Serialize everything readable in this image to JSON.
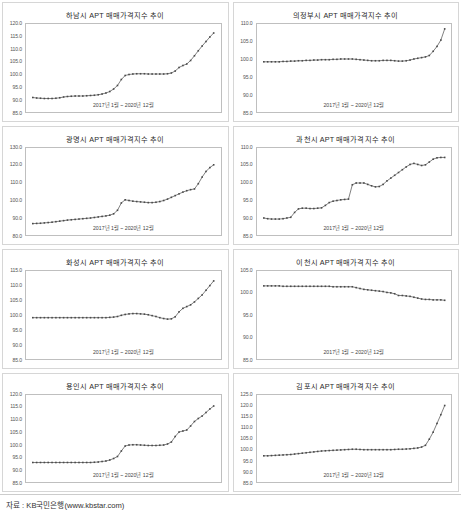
{
  "footer": {
    "source_label": "자료 : KB국민은행(www.kbstar.com)"
  },
  "common": {
    "x_caption": "2017년 1월 ~ 2020년 12월",
    "marker_color": "#4a4a4a",
    "line_color": "#4a4a4a",
    "border_color": "#bfbfbf",
    "title_color": "#2a2a2a"
  },
  "chart_data": [
    {
      "type": "line",
      "title": "하남시 APT 매매가격지수 추이",
      "xlabel": "2017년 1월 ~ 2020년 12월",
      "ylabel": "",
      "ylim": [
        85.0,
        120.0
      ],
      "yticks": [
        120.0,
        115.0,
        110.0,
        105.0,
        100.0,
        95.0,
        90.0,
        85.0
      ],
      "ytick_labels": [
        "120.0",
        "115.0",
        "110.0",
        "105.0",
        "100.0",
        "95.0",
        "90.0",
        "85.0"
      ],
      "grid": false,
      "legend": "none",
      "x_start": "2017-01",
      "x_end": "2020-12",
      "n_points": 48,
      "values": [
        90.6,
        90.4,
        90.3,
        90.2,
        90.2,
        90.2,
        90.3,
        90.5,
        90.8,
        91.0,
        91.1,
        91.2,
        91.2,
        91.2,
        91.3,
        91.4,
        91.5,
        91.7,
        92.0,
        92.4,
        93.0,
        94.0,
        95.4,
        97.8,
        99.4,
        99.8,
        100.0,
        100.1,
        100.1,
        100.1,
        100.0,
        100.0,
        100.0,
        100.0,
        100.0,
        100.1,
        100.4,
        101.2,
        102.6,
        103.4,
        104.0,
        105.4,
        107.3,
        109.3,
        111.2,
        113.0,
        114.8,
        116.4
      ]
    },
    {
      "type": "line",
      "title": "의정부시 APT 매매가격지수 추이",
      "xlabel": "2017년 1월 ~ 2020년 12월",
      "ylabel": "",
      "ylim": [
        85.0,
        110.0
      ],
      "yticks": [
        110.0,
        105.0,
        100.0,
        95.0,
        90.0,
        85.0
      ],
      "ytick_labels": [
        "110.0",
        "105.0",
        "100.0",
        "95.0",
        "90.0",
        "85.0"
      ],
      "grid": false,
      "legend": "none",
      "x_start": "2017-01",
      "x_end": "2020-12",
      "n_points": 48,
      "values": [
        99.2,
        99.2,
        99.2,
        99.2,
        99.2,
        99.3,
        99.3,
        99.4,
        99.4,
        99.5,
        99.5,
        99.6,
        99.6,
        99.7,
        99.7,
        99.8,
        99.8,
        99.8,
        99.9,
        99.9,
        100.0,
        100.0,
        100.0,
        100.0,
        99.9,
        99.8,
        99.7,
        99.6,
        99.5,
        99.5,
        99.5,
        99.6,
        99.6,
        99.6,
        99.5,
        99.4,
        99.4,
        99.5,
        99.7,
        100.0,
        100.2,
        100.4,
        100.6,
        101.0,
        102.2,
        103.6,
        105.4,
        108.6
      ]
    },
    {
      "type": "line",
      "title": "광명시 APT 매매가격지수 추이",
      "xlabel": "2017년 1월 ~ 2020년 12월",
      "ylabel": "",
      "ylim": [
        80.0,
        130.0
      ],
      "yticks": [
        130.0,
        120.0,
        110.0,
        100.0,
        90.0,
        80.0
      ],
      "ytick_labels": [
        "130.0",
        "120.0",
        "110.0",
        "100.0",
        "90.0",
        "80.0"
      ],
      "grid": false,
      "legend": "none",
      "x_start": "2017-01",
      "x_end": "2020-12",
      "n_points": 48,
      "values": [
        86.8,
        86.9,
        87.0,
        87.2,
        87.4,
        87.6,
        87.9,
        88.2,
        88.5,
        88.8,
        89.0,
        89.2,
        89.4,
        89.6,
        89.8,
        90.0,
        90.3,
        90.6,
        90.9,
        91.2,
        91.6,
        92.4,
        94.4,
        98.6,
        100.4,
        100.0,
        99.6,
        99.4,
        99.2,
        99.0,
        98.8,
        98.8,
        99.0,
        99.4,
        100.0,
        100.8,
        101.8,
        102.8,
        103.8,
        104.8,
        105.6,
        106.2,
        106.6,
        109.6,
        113.4,
        116.6,
        118.8,
        120.4
      ]
    },
    {
      "type": "line",
      "title": "과천시 APT 매매가격지수 추이",
      "xlabel": "2017년 1월 ~ 2020년 12월",
      "ylabel": "",
      "ylim": [
        85.0,
        110.0
      ],
      "yticks": [
        110.0,
        105.0,
        100.0,
        95.0,
        90.0,
        85.0
      ],
      "ytick_labels": [
        "110.0",
        "105.0",
        "100.0",
        "95.0",
        "90.0",
        "85.0"
      ],
      "grid": false,
      "legend": "none",
      "x_start": "2017-01",
      "x_end": "2020-12",
      "n_points": 48,
      "values": [
        90.0,
        89.8,
        89.7,
        89.7,
        89.7,
        89.8,
        90.0,
        90.2,
        91.6,
        92.6,
        92.8,
        92.8,
        92.7,
        92.7,
        92.8,
        92.9,
        93.6,
        94.4,
        94.8,
        95.0,
        95.2,
        95.3,
        95.4,
        99.5,
        100.0,
        100.0,
        100.0,
        99.6,
        99.2,
        98.9,
        99.0,
        99.6,
        100.6,
        101.4,
        102.2,
        103.0,
        103.8,
        104.6,
        105.3,
        105.6,
        105.3,
        105.0,
        105.2,
        106.0,
        106.8,
        107.2,
        107.3,
        107.3
      ]
    },
    {
      "type": "line",
      "title": "화성시 APT 매매가격지수 추이",
      "xlabel": "2017년 1월 ~ 2020년 12월",
      "ylabel": "",
      "ylim": [
        85.0,
        115.0
      ],
      "yticks": [
        115.0,
        110.0,
        105.0,
        100.0,
        95.0,
        90.0,
        85.0
      ],
      "ytick_labels": [
        "115.0",
        "110.0",
        "105.0",
        "100.0",
        "95.0",
        "90.0",
        "85.0"
      ],
      "grid": false,
      "legend": "none",
      "x_start": "2017-01",
      "x_end": "2020-12",
      "n_points": 48,
      "values": [
        99.0,
        99.0,
        99.0,
        99.0,
        99.0,
        99.0,
        99.0,
        99.0,
        99.0,
        99.0,
        99.0,
        99.0,
        99.0,
        99.0,
        99.0,
        99.0,
        99.0,
        99.0,
        99.0,
        99.0,
        99.1,
        99.2,
        99.4,
        99.8,
        100.1,
        100.3,
        100.4,
        100.4,
        100.3,
        100.2,
        100.0,
        99.7,
        99.4,
        99.0,
        98.7,
        98.5,
        98.6,
        99.3,
        101.0,
        102.2,
        102.8,
        103.4,
        104.4,
        105.6,
        106.8,
        108.4,
        110.0,
        111.6
      ]
    },
    {
      "type": "line",
      "title": "이천시 APT 매매가격지수 추이",
      "xlabel": "2017년 1월 ~ 2020년 12월",
      "ylabel": "",
      "ylim": [
        85.0,
        105.0
      ],
      "yticks": [
        105.0,
        100.0,
        95.0,
        90.0,
        85.0
      ],
      "ytick_labels": [
        "105.0",
        "100.0",
        "95.0",
        "90.0",
        "85.0"
      ],
      "grid": false,
      "legend": "none",
      "x_start": "2017-01",
      "x_end": "2020-12",
      "n_points": 48,
      "values": [
        101.6,
        101.6,
        101.6,
        101.6,
        101.6,
        101.5,
        101.5,
        101.5,
        101.5,
        101.5,
        101.5,
        101.5,
        101.5,
        101.5,
        101.5,
        101.5,
        101.5,
        101.5,
        101.4,
        101.4,
        101.4,
        101.4,
        101.4,
        101.4,
        101.2,
        101.0,
        100.8,
        100.7,
        100.6,
        100.5,
        100.4,
        100.3,
        100.1,
        100.0,
        99.8,
        99.4,
        99.4,
        99.3,
        99.2,
        99.0,
        98.8,
        98.6,
        98.5,
        98.5,
        98.4,
        98.4,
        98.4,
        98.3
      ]
    },
    {
      "type": "line",
      "title": "용인시 APT 매매가격지수 추이",
      "xlabel": "2017년 1월 ~ 2020년 12월",
      "ylabel": "",
      "ylim": [
        85.0,
        120.0
      ],
      "yticks": [
        120.0,
        115.0,
        110.0,
        105.0,
        100.0,
        95.0,
        90.0,
        85.0
      ],
      "ytick_labels": [
        "120.0",
        "115.0",
        "110.0",
        "105.0",
        "100.0",
        "95.0",
        "90.0",
        "85.0"
      ],
      "grid": false,
      "legend": "none",
      "x_start": "2017-01",
      "x_end": "2020-12",
      "n_points": 48,
      "values": [
        93.0,
        93.0,
        93.0,
        93.0,
        93.0,
        93.0,
        93.0,
        93.0,
        93.0,
        93.0,
        93.0,
        93.0,
        93.0,
        93.0,
        93.0,
        93.0,
        93.1,
        93.2,
        93.4,
        93.6,
        94.0,
        94.6,
        95.4,
        97.6,
        99.6,
        100.0,
        100.1,
        100.1,
        100.0,
        99.9,
        99.8,
        99.8,
        99.8,
        99.9,
        100.0,
        100.4,
        101.2,
        103.4,
        105.2,
        105.6,
        106.0,
        107.6,
        109.4,
        110.6,
        111.6,
        113.0,
        114.4,
        115.6
      ]
    },
    {
      "type": "line",
      "title": "김포시 APT 매매가격지수 추이",
      "xlabel": "2017년 1월 ~ 2020년 12월",
      "ylabel": "",
      "ylim": [
        85.0,
        125.0
      ],
      "yticks": [
        125.0,
        120.0,
        115.0,
        110.0,
        105.0,
        100.0,
        95.0,
        90.0,
        85.0
      ],
      "ytick_labels": [
        "125.0",
        "120.0",
        "115.0",
        "110.0",
        "105.0",
        "100.0",
        "95.0",
        "90.0",
        "85.0"
      ],
      "grid": false,
      "legend": "none",
      "x_start": "2017-01",
      "x_end": "2020-12",
      "n_points": 48,
      "values": [
        97.2,
        97.2,
        97.3,
        97.4,
        97.5,
        97.6,
        97.7,
        97.8,
        98.0,
        98.2,
        98.4,
        98.6,
        98.8,
        99.0,
        99.2,
        99.4,
        99.5,
        99.6,
        99.7,
        99.8,
        99.9,
        100.0,
        100.1,
        100.2,
        100.2,
        100.1,
        100.0,
        100.0,
        100.0,
        100.0,
        100.0,
        100.0,
        100.0,
        100.0,
        100.1,
        100.2,
        100.2,
        100.3,
        100.4,
        100.6,
        100.8,
        101.2,
        102.0,
        104.8,
        108.0,
        112.0,
        116.0,
        120.2
      ]
    }
  ]
}
